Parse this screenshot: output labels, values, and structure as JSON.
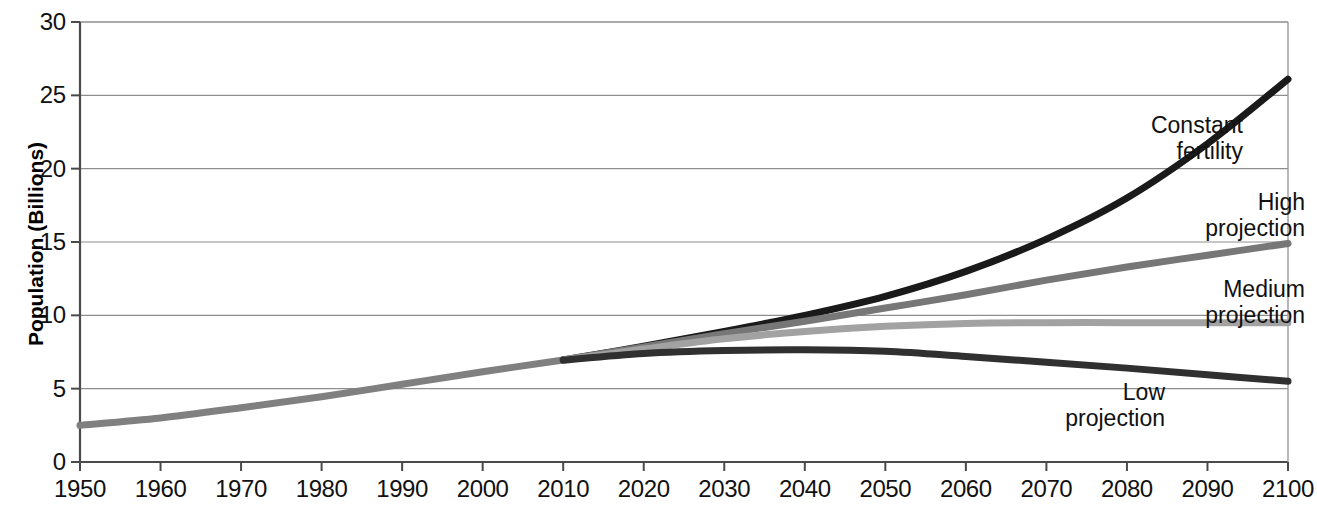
{
  "chart_data": {
    "type": "line",
    "title": "",
    "xlabel": "",
    "ylabel": "Population (Billions)",
    "xlim": [
      1950,
      2100
    ],
    "ylim": [
      0,
      30
    ],
    "grid": true,
    "legend_position": "inline-right",
    "x_ticks": [
      "1950",
      "1960",
      "1970",
      "1980",
      "1990",
      "2000",
      "2010",
      "2020",
      "2030",
      "2040",
      "2050",
      "2060",
      "2070",
      "2080",
      "2090",
      "2100"
    ],
    "y_ticks": [
      "0",
      "5",
      "10",
      "15",
      "20",
      "25",
      "30"
    ],
    "series": [
      {
        "name": "Historical",
        "color": "#808080",
        "x": [
          1950,
          1960,
          1970,
          1980,
          1990,
          2000,
          2010
        ],
        "values": [
          2.5,
          3.0,
          3.7,
          4.45,
          5.3,
          6.15,
          6.95
        ]
      },
      {
        "name": "Constant fertility",
        "color": "#1a1a1a",
        "x": [
          2010,
          2020,
          2030,
          2040,
          2050,
          2060,
          2070,
          2080,
          2090,
          2100
        ],
        "values": [
          6.95,
          7.9,
          8.9,
          10.0,
          11.3,
          13.0,
          15.2,
          18.0,
          21.7,
          26.1
        ]
      },
      {
        "name": "High projection",
        "color": "#777777",
        "x": [
          2010,
          2020,
          2030,
          2040,
          2050,
          2060,
          2070,
          2080,
          2090,
          2100
        ],
        "values": [
          6.95,
          7.85,
          8.75,
          9.6,
          10.5,
          11.4,
          12.4,
          13.3,
          14.1,
          14.9
        ]
      },
      {
        "name": "Medium projection",
        "color": "#a2a2a2",
        "x": [
          2010,
          2020,
          2030,
          2040,
          2050,
          2060,
          2070,
          2080,
          2090,
          2100
        ],
        "values": [
          6.95,
          7.7,
          8.4,
          8.9,
          9.25,
          9.45,
          9.5,
          9.5,
          9.5,
          9.5
        ]
      },
      {
        "name": "Low projection",
        "color": "#303030",
        "x": [
          2010,
          2020,
          2030,
          2040,
          2050,
          2060,
          2070,
          2080,
          2090,
          2100
        ],
        "values": [
          6.95,
          7.4,
          7.6,
          7.65,
          7.55,
          7.2,
          6.8,
          6.4,
          5.95,
          5.5
        ]
      }
    ],
    "annotations": [
      {
        "id": "constant-fertility",
        "lines": [
          "Constant",
          "fertility"
        ],
        "x": 1243,
        "y": 113,
        "align": "right"
      },
      {
        "id": "high-projection",
        "lines": [
          "High",
          "projection"
        ],
        "x": 1305,
        "y": 190,
        "align": "right"
      },
      {
        "id": "medium-projection",
        "lines": [
          "Medium",
          "projection"
        ],
        "x": 1305,
        "y": 277,
        "align": "right"
      },
      {
        "id": "low-projection",
        "lines": [
          "Low",
          "projection"
        ],
        "x": 1165,
        "y": 380,
        "align": "right"
      }
    ]
  }
}
